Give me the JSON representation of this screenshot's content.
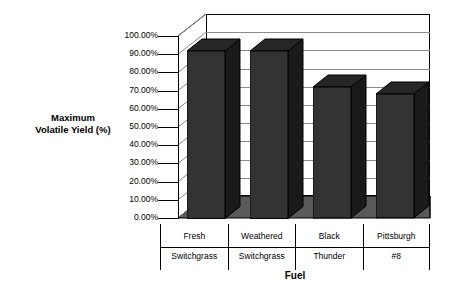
{
  "chart_data": {
    "type": "bar",
    "title": "",
    "xlabel": "Fuel",
    "ylabel": "Maximum Volatile Yield (%)",
    "categories": [
      "Fresh Switchgrass",
      "Weathered Switchgrass",
      "Black Thunder",
      "Pittsburgh #8"
    ],
    "category_lines": [
      [
        "Fresh",
        "Switchgrass"
      ],
      [
        "Weathered",
        "Switchgrass"
      ],
      [
        "Black",
        "Thunder"
      ],
      [
        "Pittsburgh",
        "#8"
      ]
    ],
    "values": [
      92,
      92,
      72,
      68
    ],
    "value_labels": [
      "92.00%",
      "92.00%",
      "72.00%",
      "68.00%"
    ],
    "ylim": [
      0,
      100
    ],
    "ytick_step": 10,
    "ytick_labels": [
      "100.00%",
      "90.00%",
      "80.00%",
      "70.00%",
      "60.00%",
      "50.00%",
      "40.00%",
      "30.00%",
      "20.00%",
      "10.00%",
      "0.00%"
    ],
    "ytick_values": [
      100,
      90,
      80,
      70,
      60,
      50,
      40,
      30,
      20,
      10,
      0
    ],
    "grid": true,
    "legend": "none",
    "style": "3d-column",
    "colors": {
      "bar_front": "#333333",
      "bar_side": "#1a1a1a",
      "bar_top": "#262626",
      "floor": "#595959",
      "gridline": "#8a8a8a",
      "axis": "#000000",
      "background": "#ffffff"
    }
  },
  "axis_titles": {
    "y_line1": "Maximum",
    "y_line2": "Volatile Yield (%)",
    "x": "Fuel"
  }
}
